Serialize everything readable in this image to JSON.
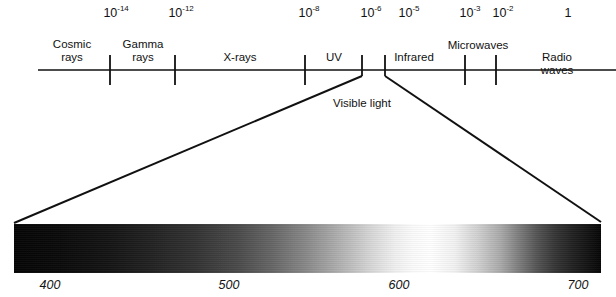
{
  "figure": {
    "kind": "electromagnetic-spectrum-diagram",
    "ink_color": "#111111",
    "background_color": "#ffffff"
  },
  "scale": {
    "unit_note": "",
    "exponent_labels": [
      {
        "mantissa": "10",
        "exponent": "-14",
        "x": 116
      },
      {
        "mantissa": "10",
        "exponent": "-12",
        "x": 181
      },
      {
        "mantissa": "10",
        "exponent": "-8",
        "x": 309
      },
      {
        "mantissa": "10",
        "exponent": "-6",
        "x": 371
      },
      {
        "mantissa": "10",
        "exponent": "-5",
        "x": 409
      },
      {
        "mantissa": "10",
        "exponent": "-3",
        "x": 470
      },
      {
        "mantissa": "10",
        "exponent": "-2",
        "x": 503
      },
      {
        "mantissa": "1",
        "exponent": "",
        "x": 568
      }
    ],
    "axis": {
      "x_start": 38,
      "x_end": 616,
      "y": 70
    },
    "ticks": [
      110,
      175,
      305,
      362,
      385,
      465,
      496
    ]
  },
  "bands": [
    {
      "name": "cosmic-rays",
      "label": "Cosmic\nrays",
      "x": 72
    },
    {
      "name": "gamma-rays",
      "label": "Gamma\nrays",
      "x": 143
    },
    {
      "name": "x-rays",
      "label": "X-rays",
      "x": 240
    },
    {
      "name": "uv",
      "label": "UV",
      "x": 334
    },
    {
      "name": "infrared",
      "label": "Infrared",
      "x": 414
    },
    {
      "name": "microwaves",
      "label": "Microwaves",
      "x": 478
    },
    {
      "name": "radio-waves",
      "label": "Radio waves",
      "x": 557
    }
  ],
  "visible_light": {
    "caption": "Visible light",
    "caption_x": 333,
    "caption_y": 98,
    "funnel": {
      "left_apex_x": 362,
      "right_apex_x": 385,
      "apex_y": 74,
      "left_base_x": 14,
      "right_base_x": 601,
      "base_y": 223
    }
  },
  "spectrum": {
    "left": 14,
    "top": 224,
    "width": 587,
    "height": 49,
    "wavelength_labels": [
      {
        "value": "400",
        "x": 50
      },
      {
        "value": "500",
        "x": 229
      },
      {
        "value": "600",
        "x": 399
      },
      {
        "value": "700",
        "x": 578
      }
    ]
  }
}
